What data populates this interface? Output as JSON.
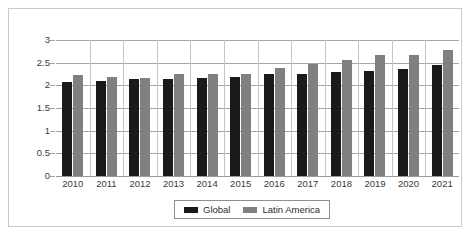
{
  "chart_data": {
    "type": "bar",
    "title": "",
    "subtitle": "",
    "xlabel": "",
    "ylabel": "",
    "categories": [
      "2010",
      "2011",
      "2012",
      "2013",
      "2014",
      "2015",
      "2016",
      "2017",
      "2018",
      "2019",
      "2020",
      "2021"
    ],
    "series": [
      {
        "name": "Global",
        "color": "#1a1a1a",
        "values": [
          2.08,
          2.1,
          2.13,
          2.13,
          2.17,
          2.19,
          2.25,
          2.26,
          2.29,
          2.31,
          2.36,
          2.44
        ]
      },
      {
        "name": "Latin America",
        "color": "#808080",
        "values": [
          2.22,
          2.19,
          2.17,
          2.24,
          2.24,
          2.26,
          2.39,
          2.46,
          2.57,
          2.68,
          2.68,
          2.77
        ]
      }
    ],
    "ylim": [
      0,
      3
    ],
    "yticks": [
      0,
      0.5,
      1,
      1.5,
      2,
      2.5,
      3
    ],
    "ytick_labels": [
      "0",
      "0.5",
      "1",
      "1.5",
      "2",
      "2.5",
      "3"
    ],
    "grid": true,
    "grid_axis": "y",
    "legend_position": "bottom-center"
  },
  "legend": {
    "entries": [
      {
        "label": "Global"
      },
      {
        "label": "Latin America"
      }
    ]
  },
  "colors": {
    "global": "#1a1a1a",
    "latin_america": "#808080",
    "gridline": "#a6a6a6",
    "frame": "#c9c9c9",
    "text": "#3a3a3a",
    "background": "#ffffff"
  }
}
